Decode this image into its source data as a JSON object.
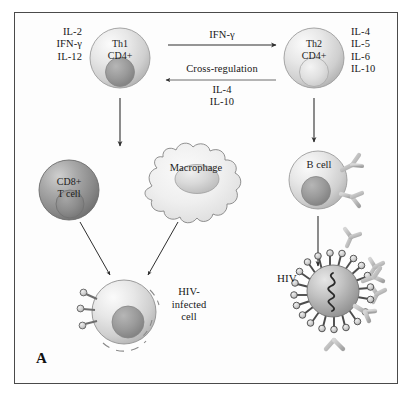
{
  "figure": {
    "panel_letter": "A",
    "title_alt": "Th1/Th2 cross-regulation and immune response to HIV"
  },
  "cells": {
    "th1": {
      "line1": "Th1",
      "line2": "CD4+",
      "name": "Th1 CD4+ helper T cell"
    },
    "th2": {
      "line1": "Th2",
      "line2": "CD4+",
      "name": "Th2 CD4+ helper T cell"
    },
    "cd8": {
      "line1": "CD8+",
      "line2": "T cell",
      "name": "CD8+ cytotoxic T cell"
    },
    "macrophage": {
      "label": "Macrophage"
    },
    "bcell": {
      "label": "B cell"
    },
    "infected": {
      "line1": "HIV-",
      "line2": "infected",
      "line3": "cell"
    },
    "hiv": {
      "label": "HIV"
    }
  },
  "cytokines": {
    "th1_left": [
      "IL-2",
      "IFN-γ",
      "IL-12"
    ],
    "th2_right": [
      "IL-4",
      "IL-5",
      "IL-6",
      "IL-10"
    ]
  },
  "arrows": {
    "th1_to_th2_label": "IFN-γ",
    "cross_regulation_label": "Cross-regulation",
    "th2_to_th1_cytokines": [
      "IL-4",
      "IL-10"
    ]
  },
  "colors": {
    "border": "#4a4a4a",
    "text": "#171717",
    "cell_fill_light": "#e4e4e4",
    "cell_fill_mid": "#c8c8c8",
    "cell_fill_dark": "#9a9a9a",
    "nucleus_dark": "#8d8d8d",
    "antibody": "#bdbdbd",
    "arrow": "#3a3a3a",
    "background": "#ffffff"
  }
}
